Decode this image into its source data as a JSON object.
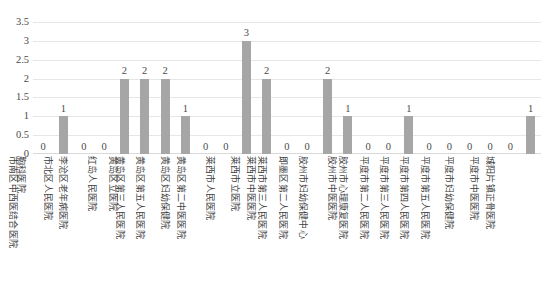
{
  "chart_data": {
    "type": "bar",
    "title": "",
    "xlabel": "",
    "ylabel": "",
    "ylim": [
      0,
      3.5
    ],
    "grid": true,
    "legend": false,
    "bar_color": "#a6a6a6",
    "y_ticks": [
      "0",
      "0.5",
      "1",
      "1.5",
      "2",
      "2.5",
      "3",
      "3.5"
    ],
    "y_tick_values": [
      0,
      0.5,
      1,
      1.5,
      2,
      2.5,
      3,
      3.5
    ],
    "categories": [
      "胸科医院",
      "市南区中西医结合医院",
      "市北区人民医院",
      "李沧区老年病医院",
      "红岛人民医院",
      "黄岛区立医院",
      "黄岛区第三人民医院",
      "黄岛区第五人民医院",
      "黄岛区妇幼保健院",
      "黄岛区第二中医医院",
      "莱西市人民医院",
      "莱西市立医院",
      "莱西市中医医院",
      "莱西市第三人民医院",
      "即墨区第二人民医院",
      "胶州市妇幼保健中心",
      "胶州市中医医院",
      "胶州市心理康复医院",
      "平度市第二人民医院",
      "平度市第三人民医院",
      "平度市第四人民医院",
      "平度市第五人民医院",
      "平度市妇幼保健院",
      "平度市中医医院",
      "城阳片镇正骨医院"
    ],
    "values": [
      0,
      1,
      0,
      0,
      2,
      2,
      2,
      1,
      0,
      0,
      3,
      2,
      0,
      0,
      2,
      1,
      0,
      0,
      1,
      0,
      0,
      0,
      0,
      0,
      1
    ],
    "value_labels": [
      "0",
      "1",
      "0",
      "0",
      "2",
      "2",
      "2",
      "1",
      "0",
      "0",
      "3",
      "2",
      "0",
      "0",
      "2",
      "1",
      "0",
      "0",
      "1",
      "0",
      "0",
      "0",
      "0",
      "0",
      "1"
    ]
  }
}
